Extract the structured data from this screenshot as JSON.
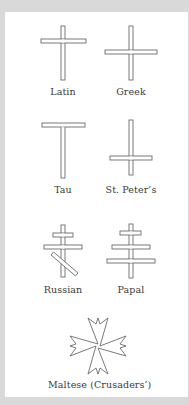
{
  "figure": {
    "stroke_color": "#6b6b6b",
    "background": "#ffffff",
    "frame_color": "#d9d9d9",
    "crosses": [
      {
        "id": "latin",
        "label": "Latin"
      },
      {
        "id": "greek",
        "label": "Greek"
      },
      {
        "id": "tau",
        "label": "Tau"
      },
      {
        "id": "st-peters",
        "label": "St. Peter’s"
      },
      {
        "id": "russian",
        "label": "Russian"
      },
      {
        "id": "papal",
        "label": "Papal"
      },
      {
        "id": "maltese",
        "label": "Maltese (Crusaders’)"
      }
    ]
  }
}
